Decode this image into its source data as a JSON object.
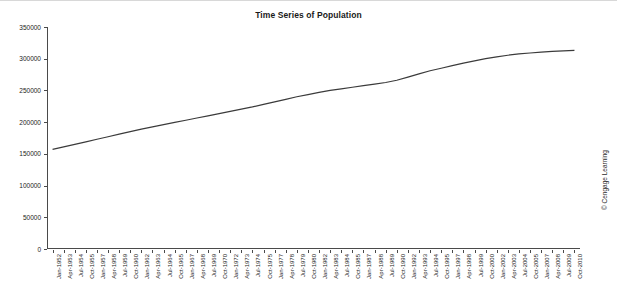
{
  "chart_data": {
    "type": "line",
    "title": "Time Series of Population",
    "xlabel": "",
    "ylabel": "",
    "ylim": [
      0,
      350000
    ],
    "yticks": [
      0,
      50000,
      100000,
      150000,
      200000,
      250000,
      300000,
      350000
    ],
    "ytick_labels": [
      "0",
      "50000",
      "100000",
      "150000",
      "200000",
      "250000",
      "300000",
      "350000"
    ],
    "grid": false,
    "legend": "none",
    "categories": [
      "Jan-1952",
      "Apr-1953",
      "Jul-1954",
      "Oct-1955",
      "Jan-1957",
      "Apr-1958",
      "Jul-1959",
      "Oct-1960",
      "Jan-1962",
      "Apr-1963",
      "Jul-1964",
      "Oct-1965",
      "Jan-1967",
      "Apr-1968",
      "Jul-1969",
      "Oct-1970",
      "Jan-1972",
      "Apr-1973",
      "Jul-1974",
      "Oct-1975",
      "Jan-1977",
      "Apr-1978",
      "Jul-1979",
      "Oct-1980",
      "Jan-1982",
      "Apr-1983",
      "Jul-1984",
      "Oct-1985",
      "Jan-1987",
      "Apr-1988",
      "Jul-1989",
      "Oct-1990",
      "Jan-1992",
      "Apr-1993",
      "Jul-1994",
      "Oct-1995",
      "Jan-1997",
      "Apr-1998",
      "Jul-1999",
      "Oct-2000",
      "Jan-2002",
      "Apr-2003",
      "Jul-2004",
      "Oct-2005",
      "Jan-2007",
      "Apr-2008",
      "Jul-2009",
      "Oct-2010"
    ],
    "values": [
      157000,
      161000,
      165000,
      169000,
      173000,
      177000,
      181000,
      185000,
      189000,
      192500,
      196000,
      199500,
      203000,
      206500,
      210000,
      213500,
      217000,
      220500,
      224000,
      228000,
      232000,
      236000,
      240000,
      243500,
      247000,
      250000,
      252500,
      255000,
      257500,
      260000,
      262500,
      266000,
      271000,
      276000,
      281000,
      285000,
      289000,
      293000,
      296500,
      300000,
      303000,
      305500,
      307500,
      309000,
      310500,
      311500,
      312500,
      313000
    ],
    "series_color": "#3b3b3b",
    "axis_color": "#4a4a4a"
  },
  "credit": {
    "text": "© Cengage Learning"
  }
}
